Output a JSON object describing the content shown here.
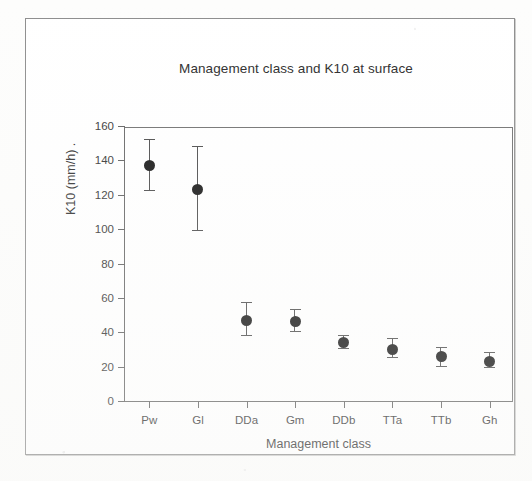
{
  "figure": {
    "border_color": "#8e8e8e",
    "page_background": "#fdfdfc"
  },
  "chart_data": {
    "type": "scatter",
    "title": "Management class and K10 at surface",
    "xlabel": "Management class",
    "ylabel": "K10 (mm/h) .",
    "categories": [
      "Pw",
      "Gl",
      "DDa",
      "Gm",
      "DDb",
      "TTa",
      "TTb",
      "Gh"
    ],
    "values": [
      137,
      123,
      47,
      46,
      34,
      30,
      26,
      23
    ],
    "error_upper": [
      152,
      148,
      57,
      53,
      38,
      36,
      31,
      28
    ],
    "error_lower": [
      122,
      99,
      38,
      40,
      30,
      25,
      20,
      19
    ],
    "ylim": [
      0,
      160
    ],
    "yticks": [
      0,
      20,
      40,
      60,
      80,
      100,
      120,
      140,
      160
    ],
    "ytick_labels": [
      "0",
      "20",
      "40",
      "60",
      "80",
      "100",
      "120",
      "140",
      "160"
    ],
    "grid": false,
    "legend": false,
    "marker": "filled-circle",
    "marker_color": "#141414",
    "errorbar_color": "#4a4a4a",
    "errorbar_style": "capped-vertical"
  }
}
